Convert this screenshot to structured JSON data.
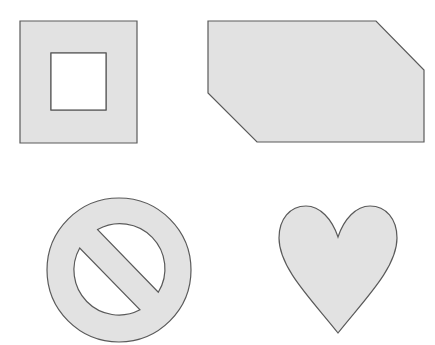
{
  "canvas": {
    "width": 435,
    "height": 345,
    "background": "#ffffff"
  },
  "style": {
    "fill": "#e2e2e2",
    "stroke": "#5a5a5a"
  },
  "shapes": [
    {
      "name": "square-frame",
      "type": "frame",
      "outer": [
        20,
        21,
        117,
        122
      ],
      "inner": [
        51,
        53,
        55,
        57
      ]
    },
    {
      "name": "snipped-rectangle",
      "type": "polygon",
      "points": "208,21 376,21 424,70 424,142 257,142 208,93"
    },
    {
      "name": "no-symbol",
      "type": "prohibition",
      "cx": 119,
      "cy": 270,
      "r_outer": 72,
      "r_inner": 45,
      "bar_half_width": 13
    },
    {
      "name": "heart",
      "type": "heart",
      "top": 206,
      "dip": [
        338,
        237
      ],
      "tip": [
        338,
        333
      ],
      "left": 279,
      "right": 397
    }
  ]
}
